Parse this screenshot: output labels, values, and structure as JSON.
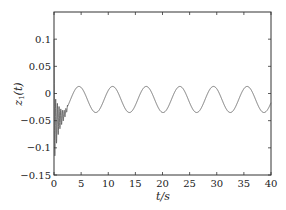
{
  "chart_data": {
    "type": "line",
    "title": "",
    "xlabel": "t/s",
    "ylabel": "z1(t)",
    "ylabel_main": "z",
    "ylabel_sub": "1",
    "ylabel_arg": "(t)",
    "xlim": [
      0,
      40
    ],
    "ylim": [
      -0.15,
      0.15
    ],
    "grid": false,
    "legend": null,
    "x_ticks": [
      0,
      5,
      10,
      15,
      20,
      25,
      30,
      35,
      40
    ],
    "x_tick_labels": [
      "0",
      "5",
      "10",
      "15",
      "20",
      "25",
      "30",
      "35",
      "40"
    ],
    "y_ticks": [
      -0.15,
      -0.1,
      -0.05,
      0,
      0.05,
      0.1
    ],
    "y_tick_labels": [
      "−0.15",
      "−0.1",
      "−0.05",
      "0",
      "0.05",
      "0.1"
    ],
    "series": [
      {
        "name": "z1(t)",
        "color": "#555555",
        "description": "Initial high-frequency damped transient (t≈0–2.5) reaching ≈0.1 and ≈−0.11, then a steady sinusoid",
        "transient": {
          "t_end": 2.5,
          "initial_spike": 0.1,
          "min_value": -0.11,
          "frequency_hz": 3.2
        },
        "steady": {
          "offset": -0.011,
          "amplitude": 0.024,
          "period": 6.2,
          "first_peak_t": 4.6,
          "peak_value": 0.013,
          "trough_value": -0.035
        },
        "peaks_t": [
          4.6,
          10.9,
          17.1,
          23.4,
          29.6,
          35.8
        ],
        "troughs_t": [
          7.7,
          14.0,
          20.2,
          26.5,
          32.7,
          38.9
        ]
      }
    ]
  }
}
